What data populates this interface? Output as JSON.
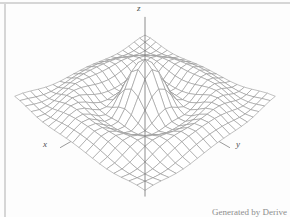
{
  "frame": {
    "background": "#fdfdfd",
    "border_color": "#d6d6d6"
  },
  "credit": {
    "text": "Generated by Derive",
    "color": "#8d8d8d"
  },
  "chart_data": {
    "type": "surface",
    "title": "",
    "function": "z = sin(r)/r, r = sqrt(x^2 + y^2)",
    "x_range": [
      -10,
      10
    ],
    "y_range": [
      -10,
      10
    ],
    "grid_cells": 20,
    "z_amplitude": 5,
    "axis_labels": {
      "x": "x",
      "y": "y",
      "z": "z"
    },
    "axes": {
      "xy_extent": 11.5,
      "z_min": -15,
      "z_max": 9.8
    },
    "style": {
      "wire_color": "#8e8e8e",
      "face_color": "#ffffff",
      "axis_color": "#6f6f6f",
      "label_color": "#4f4f4f"
    },
    "view": {
      "rotation_deg": 45,
      "elevation_deg": 35,
      "perspective_distance": 55,
      "scale": 505,
      "center_px": [
        145,
        99
      ]
    }
  }
}
